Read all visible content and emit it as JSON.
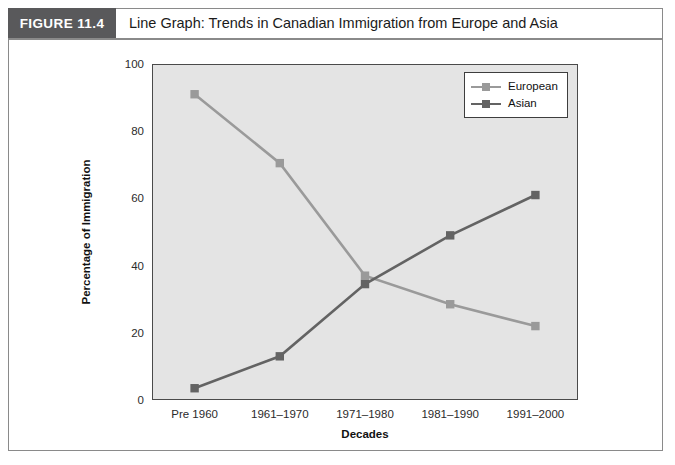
{
  "figure": {
    "badge": "FIGURE 11.4",
    "title": "Line Graph: Trends in Canadian Immigration from Europe and Asia"
  },
  "legend": {
    "position": "top-right",
    "items": [
      {
        "label": "European",
        "color": "#9a9a9a"
      },
      {
        "label": "Asian",
        "color": "#636363"
      }
    ]
  },
  "axes": {
    "y_label": "Percentage of Immigration",
    "x_label": "Decades",
    "y_ticks": [
      "0",
      "20",
      "40",
      "60",
      "80",
      "100"
    ],
    "x_ticks": [
      "Pre 1960",
      "1961–1970",
      "1971–1980",
      "1981–1990",
      "1991–2000"
    ]
  },
  "colors": {
    "european": "#9a9a9a",
    "asian": "#636363",
    "plot_background": "#e4e4e4",
    "plot_border": "#4a4a4a",
    "badge_background": "#59595b",
    "frame_border": "#8a8a8a"
  },
  "chart_data": {
    "type": "line",
    "title": "Line Graph: Trends in Canadian Immigration from Europe and Asia",
    "xlabel": "Decades",
    "ylabel": "Percentage of Immigration",
    "categories": [
      "Pre 1960",
      "1961–1970",
      "1971–1980",
      "1981–1990",
      "1991–2000"
    ],
    "series": [
      {
        "name": "European",
        "color": "#9a9a9a",
        "values": [
          91,
          70.5,
          37,
          28.5,
          22
        ]
      },
      {
        "name": "Asian",
        "color": "#636363",
        "values": [
          3.5,
          13,
          34.5,
          49,
          61
        ]
      }
    ],
    "ylim": [
      0,
      100
    ],
    "ytick_step": 20,
    "grid": false,
    "legend_position": "top-right",
    "markers": "square"
  }
}
